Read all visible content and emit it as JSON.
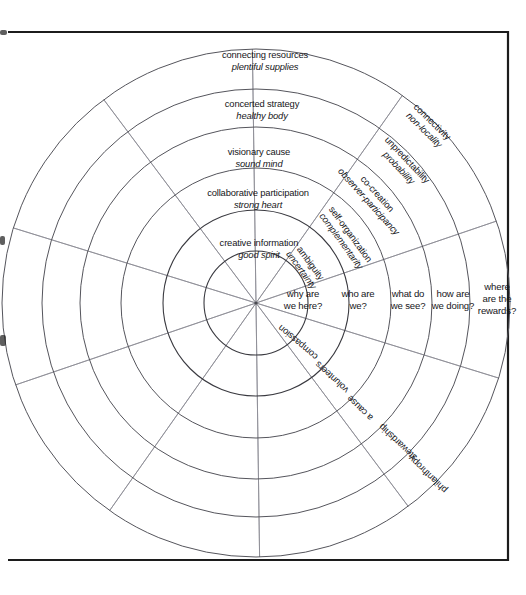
{
  "diagram": {
    "center": {
      "x": 256,
      "y": 303
    },
    "rings": [
      52,
      93,
      135,
      176,
      214,
      254
    ],
    "spoke_count": 10,
    "colors": {
      "ring_stroke": "#55555c",
      "spoke_stroke": "#8a8a93",
      "frame_stroke": "#1c1c1c",
      "text": "#16161a",
      "background": "#ffffff"
    },
    "upper_labels": [
      {
        "primary": "connecting resources",
        "secondary": "plentiful supplies",
        "x": 265,
        "y": 58
      },
      {
        "primary": "concerted strategy",
        "secondary": "healthy body",
        "x": 262,
        "y": 107
      },
      {
        "primary": "visionary cause",
        "secondary": "sound mind",
        "x": 259,
        "y": 155
      },
      {
        "primary": "collaborative participation",
        "secondary": "strong heart",
        "x": 258,
        "y": 196
      },
      {
        "primary": "creative information",
        "secondary": "good spirit",
        "x": 259,
        "y": 246
      }
    ],
    "right_labels": [
      {
        "primary": "connectivity",
        "secondary": "non-locality",
        "x": 430,
        "y": 124
      },
      {
        "primary": "unpredictability",
        "secondary": "probability",
        "x": 405,
        "y": 162
      },
      {
        "primary": "co-creation",
        "secondary": "observer-participancy",
        "x": 375,
        "y": 196
      },
      {
        "primary": "self-organization",
        "secondary": "complementarity",
        "x": 348,
        "y": 236
      },
      {
        "primary": "ambiguity",
        "secondary": "uncertainty",
        "x": 308,
        "y": 265
      }
    ],
    "questions": [
      {
        "line1": "why are",
        "line2": "we here?",
        "x": 303,
        "y": 297
      },
      {
        "line1": "who are",
        "line2": "we?",
        "x": 358,
        "y": 297
      },
      {
        "line1": "what do",
        "line2": "we see?",
        "x": 408,
        "y": 297
      },
      {
        "line1": "how are",
        "line2": "we doing?",
        "x": 453,
        "y": 297
      },
      {
        "line1": "where",
        "line2": "are the",
        "line3": "rewards?",
        "x": 497,
        "y": 290
      }
    ],
    "lower_labels": [
      {
        "text": "compassion",
        "x": 300,
        "y": 340
      },
      {
        "text": "volunteers",
        "x": 334,
        "y": 375
      },
      {
        "text": "a cause",
        "x": 362,
        "y": 406
      },
      {
        "text": "stewardship",
        "x": 400,
        "y": 440
      },
      {
        "text": "philanthropy",
        "x": 430,
        "y": 472
      }
    ]
  }
}
